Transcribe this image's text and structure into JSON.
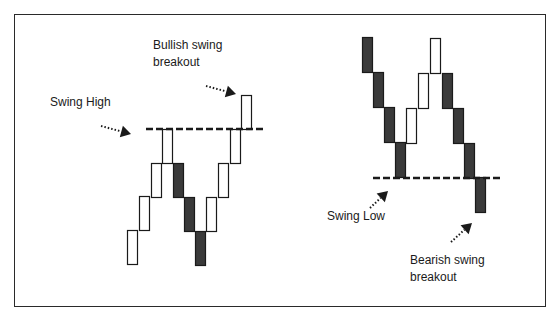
{
  "colors": {
    "bullish_fill": "#ffffff",
    "bearish_fill": "#3a3a3a",
    "stroke": "#1a1a1a",
    "line": "#1a1a1a"
  },
  "labels": {
    "bullish_breakout_line1": "Bullish swing",
    "bullish_breakout_line2": "breakout",
    "swing_high": "Swing High",
    "swing_low": "Swing Low",
    "bearish_breakout_line1": "Bearish swing",
    "bearish_breakout_line2": "breakout"
  },
  "left_panel": {
    "title": "Swing High / Bullish swing breakout",
    "brick_height": 34,
    "brick_width": 10,
    "bricks": [
      {
        "x": 127,
        "y": 230,
        "type": "bullish"
      },
      {
        "x": 139,
        "y": 196,
        "type": "bullish"
      },
      {
        "x": 151,
        "y": 163,
        "type": "bullish"
      },
      {
        "x": 162,
        "y": 129,
        "type": "bullish"
      },
      {
        "x": 173,
        "y": 163,
        "type": "bearish"
      },
      {
        "x": 184,
        "y": 197,
        "type": "bearish"
      },
      {
        "x": 195,
        "y": 231,
        "type": "bearish"
      },
      {
        "x": 206,
        "y": 197,
        "type": "bullish"
      },
      {
        "x": 218,
        "y": 163,
        "type": "bullish"
      },
      {
        "x": 230,
        "y": 129,
        "type": "bullish"
      },
      {
        "x": 241,
        "y": 95,
        "type": "bullish"
      }
    ],
    "level_line": {
      "x1": 146,
      "x2": 263,
      "y": 129
    },
    "arrows": [
      {
        "name": "swing-high-arrow",
        "x1": 101,
        "y1": 126,
        "x2": 131,
        "y2": 134
      },
      {
        "name": "bullish-breakout-arrow",
        "x1": 206,
        "y1": 86,
        "x2": 236,
        "y2": 94
      }
    ]
  },
  "right_panel": {
    "title": "Swing Low / Bearish swing breakout",
    "brick_height": 35,
    "brick_width": 10,
    "bricks": [
      {
        "x": 362,
        "y": 37,
        "type": "bearish"
      },
      {
        "x": 373,
        "y": 72,
        "type": "bearish"
      },
      {
        "x": 384,
        "y": 107,
        "type": "bearish"
      },
      {
        "x": 395,
        "y": 142,
        "type": "bearish"
      },
      {
        "x": 406,
        "y": 108,
        "type": "bullish"
      },
      {
        "x": 418,
        "y": 73,
        "type": "bullish"
      },
      {
        "x": 430,
        "y": 38,
        "type": "bullish"
      },
      {
        "x": 442,
        "y": 73,
        "type": "bearish"
      },
      {
        "x": 453,
        "y": 108,
        "type": "bearish"
      },
      {
        "x": 464,
        "y": 143,
        "type": "bearish"
      },
      {
        "x": 475,
        "y": 177,
        "type": "bearish"
      }
    ],
    "level_line": {
      "x1": 373,
      "x2": 501,
      "y": 178
    },
    "arrows": [
      {
        "name": "swing-low-arrow",
        "x1": 370,
        "y1": 208,
        "x2": 388,
        "y2": 191
      },
      {
        "name": "bearish-breakout-arrow",
        "x1": 451,
        "y1": 242,
        "x2": 472,
        "y2": 223
      }
    ]
  }
}
